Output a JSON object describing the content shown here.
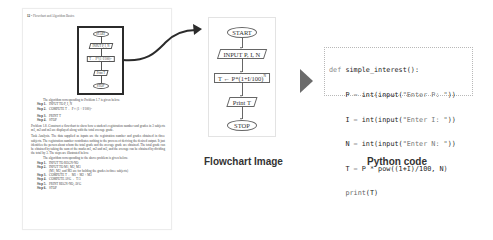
{
  "book_page": {
    "header_number": "12",
    "header_title": "Flowchart and Algorithm Basics",
    "mini_flowchart": {
      "start": "START",
      "input": "INPUT P, I, N",
      "compute": "T ← P*(1+I/100)ᴺ",
      "print": "Print T",
      "stop": "STOP"
    },
    "intro": "The algorithm corresponding to Problem 1.7 is given below.",
    "steps_1": [
      {
        "label": "Step 1.",
        "text": "INPUT TO P, I, N"
      },
      {
        "label": "Step 2.",
        "text": "COMPUTE T ← P × (1 + I/100)ᴺ"
      },
      {
        "label": "Step 3.",
        "text": "PRINT T"
      },
      {
        "label": "Step 4.",
        "text": "STOP"
      }
    ],
    "problem": "Problem 1.8. Construct a flowchart to show how a student's registration number and grades in 3 subjects m1, m2 and m3 are displayed along with the total average grade.",
    "task_analysis": "Task Analysis. The data supplied as inputs are the registration number and grades obtained in three subjects. The registration number contributes nothing to the process of deriving the desired output. It just identifies the person about whom the total grade and the average grade are obtained. The total grade can be obtained by taking the sum of the marks m1, m2 and m3, and the average can be obtained by dividing the total by 3. The steps are illustrated below.",
    "intro_2": "The algorithm corresponding to the above problem is given below.",
    "steps_2": [
      {
        "label": "Step 1.",
        "text": "INPUT TO REGN-NO"
      },
      {
        "label": "Step 2.",
        "text": "INPUT TO M1, M2, M3"
      },
      {
        "label": "",
        "text": "(M1, M2, and M3 are for holding the grades in three subjects)"
      },
      {
        "label": "Step 3.",
        "text": "COMPUTE T ← M1 + M2 + M3"
      },
      {
        "label": "Step 4.",
        "text": "COMPUTE AVG ← T/3"
      },
      {
        "label": "Step 5.",
        "text": "PRINT REGN-NO, AVG"
      },
      {
        "label": "Step 6.",
        "text": "STOP"
      }
    ]
  },
  "flowchart": {
    "caption": "Flowchart Image",
    "start": "START",
    "input": "INPUT P, I, N",
    "compute_prefix": "T ← P*(1+I/100)",
    "compute_exponent": "N",
    "print": "Print T",
    "stop": "STOP"
  },
  "code": {
    "caption": "Python code",
    "lines": [
      {
        "kw": "def ",
        "rest": "simple_interest():"
      },
      {
        "indent": "    ",
        "var": "P",
        "eq": " = ",
        "call": "int(input(",
        "str": "\"Enter P: \"",
        "end": "))"
      },
      {
        "indent": "    ",
        "var": "I",
        "eq": " = ",
        "call": "int(input(",
        "str": "\"Enter I: \"",
        "end": "))"
      },
      {
        "indent": "    ",
        "var": "N",
        "eq": " = ",
        "call": "int(input(",
        "str": "\"Enter N: \"",
        "end": "))"
      },
      {
        "indent": "    ",
        "var": "T",
        "eq": " = ",
        "call": "P * pow((1+I)/100, N)",
        "str": "",
        "end": ""
      },
      {
        "indent": "    ",
        "var": "print",
        "eq": "",
        "call": "(T)",
        "str": "",
        "end": ""
      }
    ]
  },
  "colors": {
    "frame_border": "#2b2b2b",
    "arrow": "#6b6b6b",
    "caption": "#333333"
  }
}
